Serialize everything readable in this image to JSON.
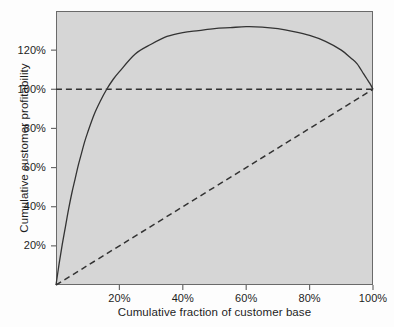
{
  "chart_data": {
    "type": "line",
    "title": "",
    "subtitle": "",
    "xlabel": "Cumulative fraction of customer base",
    "ylabel": "Cumulative customer profitability",
    "xlim": [
      0,
      100
    ],
    "ylim": [
      0,
      140
    ],
    "grid": false,
    "legend": "none",
    "plot_background_color": "#d6d6d6",
    "figure_background_color": "#fdfdfd",
    "axis_color": "#6a6a6a",
    "xticks": [
      20,
      40,
      60,
      80,
      100
    ],
    "xtick_labels": [
      "20%",
      "40%",
      "60%",
      "80%",
      "100%"
    ],
    "yticks": [
      20,
      40,
      60,
      80,
      100,
      120
    ],
    "ytick_labels": [
      "20%",
      "40%",
      "60%",
      "80%",
      "100%",
      "120%"
    ],
    "series": [
      {
        "name": "Cumulative customer profitability curve",
        "style": "solid",
        "color": "#333333",
        "x": [
          0,
          1,
          2,
          3,
          4,
          5,
          6,
          7,
          8,
          9,
          10,
          12,
          14,
          16,
          18,
          20,
          25,
          30,
          35,
          40,
          45,
          50,
          55,
          60,
          65,
          70,
          75,
          80,
          85,
          90,
          93,
          95,
          97,
          98,
          99,
          100
        ],
        "y": [
          0,
          11,
          21,
          30,
          39,
          47,
          54,
          61,
          67,
          73,
          78,
          87,
          94,
          100,
          105,
          109,
          118,
          123,
          127,
          129,
          130,
          131,
          131.5,
          132,
          131.8,
          131,
          129.5,
          127.5,
          124.5,
          120,
          116,
          113,
          108,
          105.5,
          103,
          100
        ]
      },
      {
        "name": "Diagonal reference line",
        "style": "dashed",
        "color": "#333333",
        "x": [
          0,
          100
        ],
        "y": [
          0,
          100
        ]
      },
      {
        "name": "100 percent reference line",
        "style": "dashed",
        "color": "#333333",
        "x": [
          0,
          100
        ],
        "y": [
          100,
          100
        ]
      }
    ],
    "annotations": []
  }
}
